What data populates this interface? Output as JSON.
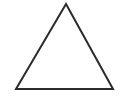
{
  "canvas": {
    "width": 121,
    "height": 104,
    "background_color": "#ffffff",
    "alt_text": "Outline of an isoceles triangle"
  },
  "figure": {
    "name": "triangle",
    "shape_type": "triangle",
    "fill": "none",
    "fill_color": "#ffffff",
    "stroke_color": "#2b2b2b",
    "stroke_width": 2,
    "closed": true,
    "vertices": [
      {
        "label": "apex",
        "x": 66,
        "y": 4
      },
      {
        "label": "bottom-right",
        "x": 113,
        "y": 89
      },
      {
        "label": "bottom-left",
        "x": 16,
        "y": 89
      }
    ],
    "points_attr": "66,4 113,89 16,89"
  },
  "annotations": {
    "labels": [],
    "title": "",
    "caption": ""
  }
}
